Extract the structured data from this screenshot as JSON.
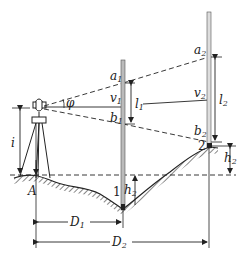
{
  "diagram": {
    "title": "",
    "labels": {
      "A": "A",
      "i": "i",
      "phi": "φ",
      "a1": "a",
      "a1_sub": "1",
      "v1": "v",
      "v1_sub": "1",
      "b1": "b",
      "b1_sub": "1",
      "l1": "l",
      "l1_sub": "1",
      "a2": "a",
      "a2_sub": "2",
      "v2": "v",
      "v2_sub": "2",
      "b2": "b",
      "b2_sub": "2",
      "l2": "l",
      "l2_sub": "2",
      "h1": "h",
      "h1_sub": "2",
      "h2": "h",
      "h2_sub": "2",
      "D1": "D",
      "D1_sub": "1",
      "D2": "D",
      "D2_sub": "2",
      "point1": "1",
      "point2": "2"
    },
    "colors": {
      "line": "#222222",
      "rod": "#888888"
    }
  }
}
